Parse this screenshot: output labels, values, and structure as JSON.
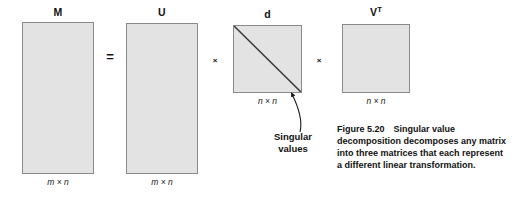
{
  "figure": {
    "matrices": [
      {
        "key": "m",
        "name": "M",
        "name_sup": "",
        "dimension": "m × n",
        "shape": "tall-rectangle",
        "fill": "#e3e3e3",
        "stroke": "#8a8a8a"
      },
      {
        "key": "u",
        "name": "U",
        "name_sup": "",
        "dimension": "m × n",
        "shape": "tall-rectangle",
        "fill": "#e3e3e3",
        "stroke": "#8a8a8a"
      },
      {
        "key": "d",
        "name": "d",
        "name_sup": "",
        "dimension": "n × n",
        "shape": "square-with-diagonal",
        "fill": "#e3e3e3",
        "stroke": "#8a8a8a"
      },
      {
        "key": "vt",
        "name": "V",
        "name_sup": "T",
        "dimension": "n × n",
        "shape": "square",
        "fill": "#e3e3e3",
        "stroke": "#8a8a8a"
      }
    ],
    "operators": {
      "equals": "=",
      "times_1": "×",
      "times_2": "×"
    },
    "annotation": {
      "label_line_1": "Singular",
      "label_line_2": "values",
      "points_to": "d"
    },
    "caption": {
      "number": "Figure 5.20",
      "text": "Singular value decomposition decomposes any matrix into three matrices that each represent a different linear transformation."
    }
  }
}
